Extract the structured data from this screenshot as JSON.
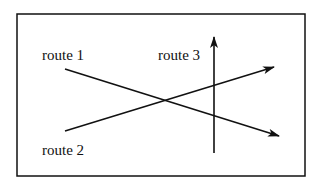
{
  "diagram": {
    "type": "route-crossing",
    "colors": {
      "stroke": "#111111",
      "background": "#ffffff"
    },
    "routes": [
      {
        "label": "route 1",
        "direction": "down-right"
      },
      {
        "label": "route 2",
        "direction": "up-right"
      },
      {
        "label": "route 3",
        "direction": "up"
      }
    ]
  }
}
